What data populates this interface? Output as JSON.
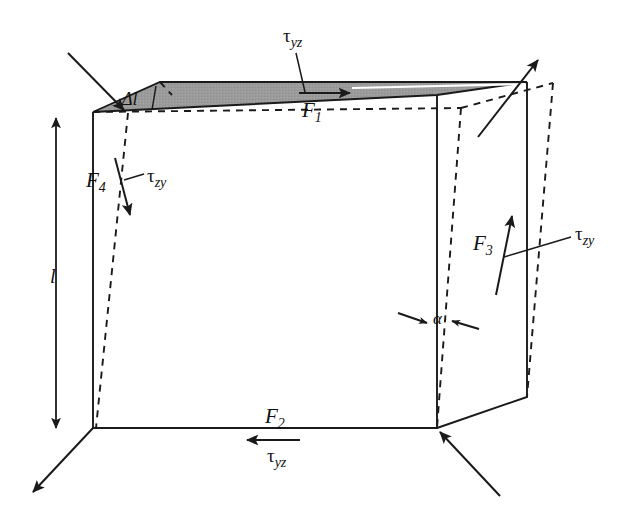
{
  "figure": {
    "kind": "shear-deformation-cube"
  },
  "colors": {
    "ink": "#1a1a1a",
    "top_face_fill": "#9a9a9a",
    "highlight": "#ffffff",
    "background": "#ffffff"
  },
  "labels": {
    "force_top": {
      "symbol": "F",
      "subscript": "1"
    },
    "force_bottom": {
      "symbol": "F",
      "subscript": "2"
    },
    "force_right": {
      "symbol": "F",
      "subscript": "3"
    },
    "force_left": {
      "symbol": "F",
      "subscript": "4"
    },
    "tau_top": {
      "symbol": "τ",
      "subscript": "yz"
    },
    "tau_bottom": {
      "symbol": "τ",
      "subscript": "yz"
    },
    "tau_left": {
      "symbol": "τ",
      "subscript": "zy"
    },
    "tau_right": {
      "symbol": "τ",
      "subscript": "zy"
    },
    "delta_length": "Δl",
    "edge_length": "l",
    "shear_angle": "α"
  },
  "geometry": {
    "front_face": "93,428 93,112 437,428 437,95",
    "top_face_fill_points": "93,112 160,82 527,82 437,95",
    "cube_notes": "left vertical edge x=93 (y 112-428), right front vertical edge x=437 (y 95-428), right side face extends to x=527"
  }
}
